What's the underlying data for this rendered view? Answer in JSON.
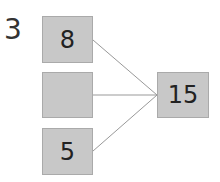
{
  "problem_number": "3",
  "inputs": [
    "8",
    "",
    "5"
  ],
  "result": "15",
  "colors": {
    "box": "#c8c8c8",
    "line": "#999999"
  }
}
